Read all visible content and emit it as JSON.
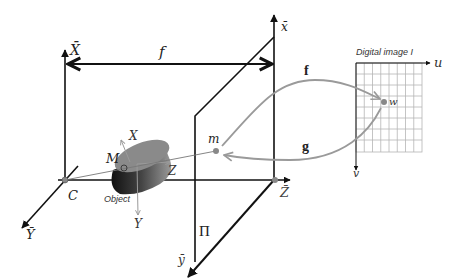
{
  "diagram": {
    "labels": {
      "X_bar": "X̄",
      "Y_bar": "Ȳ",
      "Z_bar": "Z̄",
      "x_bar": "x̄",
      "y_bar": "ȳ",
      "focal": "f",
      "camera_center": "C",
      "object_point": "M",
      "object": "Object",
      "obj_X": "X",
      "obj_Y": "Y",
      "obj_Z": "Z",
      "image_point": "m",
      "plane": "Π",
      "map_f": "f",
      "map_g": "g",
      "digital_image_title": "Digital image I",
      "u_axis": "u",
      "v_axis": "v",
      "pixel_point": "w"
    },
    "grid": {
      "columns": 8,
      "rows": 8
    },
    "colors": {
      "axis": "#111111",
      "gray_arrow": "#9a9a9a",
      "grid_line": "#b5b5b5",
      "point": "#888888",
      "object_top": "#8a8a8a",
      "object_side": "#222222"
    }
  }
}
